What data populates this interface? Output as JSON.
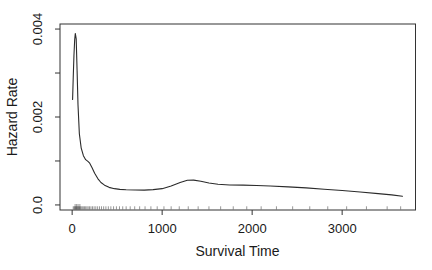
{
  "chart_data": {
    "type": "line",
    "title": "",
    "xlabel": "Survival Time",
    "ylabel": "Hazard Rate",
    "xlim": [
      -135,
      3815
    ],
    "ylim": [
      -0.000115,
      0.004115
    ],
    "grid": false,
    "legend": "none",
    "x_ticks": [
      {
        "value": 0,
        "label": "0"
      },
      {
        "value": 1000,
        "label": "1000"
      },
      {
        "value": 2000,
        "label": "2000"
      },
      {
        "value": 3000,
        "label": "3000"
      }
    ],
    "y_ticks": [
      {
        "value": 0.0,
        "label": "0.0"
      },
      {
        "value": 0.001,
        "label": ""
      },
      {
        "value": 0.002,
        "label": "0.002"
      },
      {
        "value": 0.003,
        "label": ""
      },
      {
        "value": 0.004,
        "label": "0.004"
      }
    ],
    "series": [
      {
        "name": "hazard-estimate",
        "color": "#2b2b2b",
        "points": [
          [
            5,
            0.0024
          ],
          [
            12,
            0.0029
          ],
          [
            20,
            0.0034
          ],
          [
            28,
            0.00375
          ],
          [
            35,
            0.0039
          ],
          [
            45,
            0.00378
          ],
          [
            55,
            0.00305
          ],
          [
            65,
            0.00228
          ],
          [
            80,
            0.00162
          ],
          [
            100,
            0.0013
          ],
          [
            125,
            0.00112
          ],
          [
            150,
            0.00103
          ],
          [
            175,
            0.00099
          ],
          [
            195,
            0.00095
          ],
          [
            220,
            0.00085
          ],
          [
            250,
            0.00072
          ],
          [
            285,
            0.0006
          ],
          [
            320,
            0.00051
          ],
          [
            360,
            0.00045
          ],
          [
            410,
            0.0004
          ],
          [
            470,
            0.00037
          ],
          [
            530,
            0.000355
          ],
          [
            600,
            0.000345
          ],
          [
            700,
            0.00034
          ],
          [
            800,
            0.000338
          ],
          [
            900,
            0.000348
          ],
          [
            1000,
            0.00037
          ],
          [
            1100,
            0.00043
          ],
          [
            1200,
            0.00051
          ],
          [
            1280,
            0.00056
          ],
          [
            1350,
            0.000565
          ],
          [
            1430,
            0.00054
          ],
          [
            1520,
            0.0005
          ],
          [
            1620,
            0.00047
          ],
          [
            1750,
            0.000455
          ],
          [
            1900,
            0.00045
          ],
          [
            2050,
            0.000443
          ],
          [
            2200,
            0.000432
          ],
          [
            2400,
            0.000412
          ],
          [
            2600,
            0.000388
          ],
          [
            2800,
            0.000358
          ],
          [
            3000,
            0.000328
          ],
          [
            3200,
            0.000293
          ],
          [
            3400,
            0.000257
          ],
          [
            3550,
            0.000228
          ],
          [
            3670,
            0.000196
          ]
        ]
      }
    ],
    "rug": {
      "times": [
        12,
        22,
        30,
        38,
        47,
        55,
        63,
        72,
        81,
        90,
        100,
        112,
        124,
        137,
        150,
        164,
        178,
        193,
        209,
        226,
        244,
        263,
        283,
        304,
        326,
        350,
        375,
        402,
        430,
        460,
        492,
        526,
        562,
        600,
        645,
        695,
        750,
        810,
        875,
        945,
        1020,
        1100,
        1190,
        1290,
        1400,
        1520,
        1650,
        1790,
        1940,
        2100,
        2270,
        2450,
        2640,
        2840,
        3050,
        3270,
        3500,
        3650
      ],
      "tall_times": [
        33,
        50,
        66,
        86
      ],
      "height": 3.2,
      "tall_height": 5.5,
      "color": "#444444",
      "opacity": 0.55
    },
    "colors": {
      "axis": "#333333",
      "text": "#1a1a1a",
      "background": "#ffffff"
    }
  }
}
